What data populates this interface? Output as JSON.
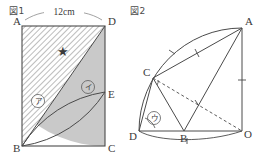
{
  "figures": [
    {
      "caption": "図1",
      "labels": {
        "A": "A",
        "B": "B",
        "C": "C",
        "D": "D",
        "E": "E"
      },
      "dimension": "12cm",
      "regions": [
        {
          "name": "region-a",
          "label": "ア",
          "fill": "hatched"
        },
        {
          "name": "region-i",
          "label": "イ",
          "fill": "gray"
        },
        {
          "name": "region-star",
          "label": "★",
          "fill": "white"
        }
      ]
    },
    {
      "caption": "図2",
      "labels": {
        "A": "A",
        "B": "B",
        "C": "C",
        "D": "D",
        "O": "O"
      },
      "regions": [
        {
          "name": "region-u",
          "label": "ウ",
          "fill": "white"
        }
      ]
    }
  ],
  "colors": {
    "stroke": "#4a4a4a",
    "gray_fill": "#c9c9c9",
    "hatch": "#6a6a6a",
    "star": "#1a1a1a",
    "text": "#3a3a3a"
  }
}
